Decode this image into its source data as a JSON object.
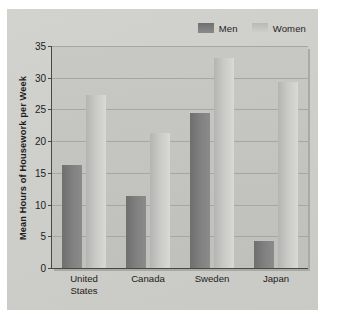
{
  "chart_data": {
    "type": "bar",
    "title": "",
    "xlabel": "",
    "ylabel": "Mean Hours of Housework per Week",
    "categories": [
      "United States",
      "Canada",
      "Sweden",
      "Japan"
    ],
    "category_lines": [
      [
        "United",
        "States"
      ],
      [
        "Canada"
      ],
      [
        "Sweden"
      ],
      [
        "Japan"
      ]
    ],
    "series": [
      {
        "name": "Men",
        "color": "#7e7e7e",
        "values": [
          16.2,
          11.4,
          24.4,
          4.3
        ]
      },
      {
        "name": "Women",
        "color": "#c6c6c4",
        "values": [
          27.2,
          21.3,
          33.1,
          29.3
        ]
      }
    ],
    "ylim": [
      0,
      35
    ],
    "ytick_step": 5,
    "yticks": [
      0,
      5,
      10,
      15,
      20,
      25,
      30,
      35
    ],
    "ytick_labels": [
      "0",
      "5",
      "10",
      "15",
      "20",
      "25",
      "30",
      "35"
    ],
    "grid": true,
    "legend_position": "top-right"
  },
  "legend": {
    "entries": [
      {
        "label": "Men",
        "swatch": "men-swatch"
      },
      {
        "label": "Women",
        "swatch": "women-swatch"
      }
    ]
  },
  "axes": {
    "y_title": "Mean Hours of Housework per Week"
  },
  "colors": {
    "card_background": "#cdcdc9",
    "plot_background": "#c4c4c0",
    "axis_line": "#4a4845",
    "gridline": "#a6a6a2",
    "men_bar": "#7e7e7e",
    "women_bar": "#c6c6c4",
    "text": "#1e1c19"
  }
}
